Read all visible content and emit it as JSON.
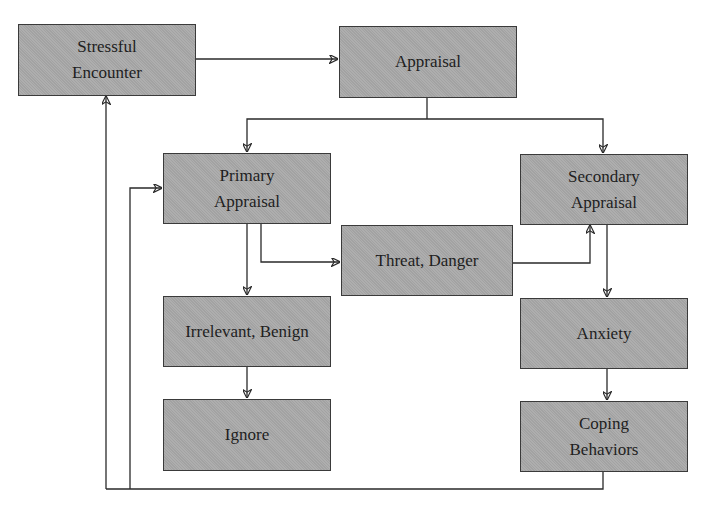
{
  "diagram": {
    "type": "flowchart",
    "colors": {
      "node_fill": "#a9a9a9",
      "node_border": "#3a3a3a",
      "line": "#2a2a2a",
      "text": "#1e1e1e",
      "background": "#ffffff"
    },
    "nodes": {
      "stressful_encounter": {
        "label": "Stressful\nEncounter"
      },
      "appraisal": {
        "label": "Appraisal"
      },
      "primary_appraisal": {
        "label": "Primary\nAppraisal"
      },
      "secondary_appraisal": {
        "label": "Secondary\nAppraisal"
      },
      "threat_danger": {
        "label": "Threat, Danger"
      },
      "irrelevant_benign": {
        "label": "Irrelevant, Benign"
      },
      "ignore": {
        "label": "Ignore"
      },
      "anxiety": {
        "label": "Anxiety"
      },
      "coping_behaviors": {
        "label": "Coping\nBehaviors"
      }
    },
    "edges": [
      {
        "from": "Stressful Encounter",
        "to": "Appraisal"
      },
      {
        "from": "Appraisal",
        "to": "Primary Appraisal"
      },
      {
        "from": "Appraisal",
        "to": "Secondary Appraisal"
      },
      {
        "from": "Primary Appraisal",
        "to": "Threat, Danger"
      },
      {
        "from": "Primary Appraisal",
        "to": "Irrelevant, Benign"
      },
      {
        "from": "Threat, Danger",
        "to": "Secondary Appraisal"
      },
      {
        "from": "Irrelevant, Benign",
        "to": "Ignore"
      },
      {
        "from": "Secondary Appraisal",
        "to": "Anxiety"
      },
      {
        "from": "Anxiety",
        "to": "Coping Behaviors"
      },
      {
        "from": "Coping Behaviors",
        "to": "Stressful Encounter"
      },
      {
        "from": "Coping Behaviors",
        "to": "Primary Appraisal"
      }
    ]
  }
}
